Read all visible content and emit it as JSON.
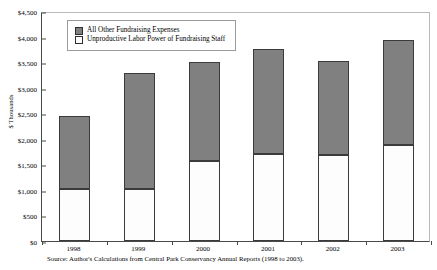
{
  "chart_data": {
    "type": "bar",
    "title": "",
    "xlabel": "",
    "ylabel": "$ Thousands",
    "categories": [
      "1998",
      "1999",
      "2000",
      "2001",
      "2002",
      "2003"
    ],
    "stacked": true,
    "grid": false,
    "legend_position": "top-left-inside",
    "ylim": [
      0,
      4500
    ],
    "ytick_labels": [
      "$4,500",
      "$4,000",
      "$3,500",
      "$3,000",
      "$2,500",
      "$2,000",
      "$1,500",
      "$1,000",
      "$500",
      "$0"
    ],
    "ytick_values": [
      4500,
      4000,
      3500,
      3000,
      2500,
      2000,
      1500,
      1000,
      500,
      0
    ],
    "series": [
      {
        "name": "Unproductive Labor Power of Fundraising Staff",
        "color": "#ffffff",
        "values": [
          1020,
          1010,
          1560,
          1700,
          1680,
          1870
        ]
      },
      {
        "name": "All Other Fundraising Expenses",
        "color": "#808080",
        "values": [
          1420,
          2270,
          1940,
          2050,
          1840,
          2070
        ]
      }
    ],
    "totals": [
      2440,
      3280,
      3500,
      3750,
      3520,
      3940
    ],
    "source_note": "Source: Author's Calculations from Central Park Conservancy Annual Reports (1998 to 2003)."
  },
  "legend": {
    "items": [
      {
        "label": "All Other Fundraising Expenses",
        "swatch": "dark-gray-swatch"
      },
      {
        "label": "Unproductive Labor Power of Fundraising Staff",
        "swatch": "white-swatch"
      }
    ]
  }
}
